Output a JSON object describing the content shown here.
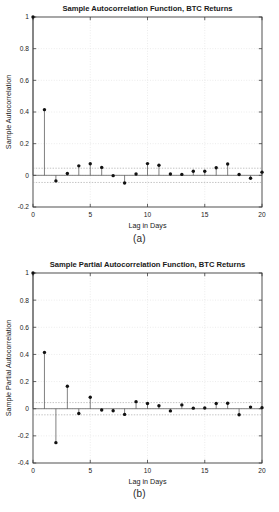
{
  "figure": {
    "panels": [
      {
        "id": "panel-a",
        "caption": "(a)",
        "chart_ref": 0
      },
      {
        "id": "panel-b",
        "caption": "(b)",
        "chart_ref": 1
      }
    ]
  },
  "chart_data": [
    {
      "type": "bar",
      "subtype": "stem",
      "title": "Sample Autocorrelation Function, BTC Returns",
      "xlabel": "Lag in Days",
      "ylabel": "Sample Autocorrelation",
      "categories": [
        0,
        1,
        2,
        3,
        4,
        5,
        6,
        7,
        8,
        9,
        10,
        11,
        12,
        13,
        14,
        15,
        16,
        17,
        18,
        19,
        20
      ],
      "values": [
        1.0,
        0.415,
        -0.035,
        0.012,
        0.06,
        0.073,
        0.05,
        -0.002,
        -0.048,
        0.008,
        0.074,
        0.064,
        0.008,
        0.006,
        0.026,
        0.026,
        0.048,
        0.072,
        0.005,
        -0.018,
        0.02
      ],
      "xlim": [
        0,
        20
      ],
      "ylim": [
        -0.2,
        1.0
      ],
      "xticks": [
        0,
        5,
        10,
        15,
        20
      ],
      "xticklabels": [
        "0",
        "5",
        "10",
        "15",
        "20"
      ],
      "yticks": [
        -0.2,
        0,
        0.2,
        0.4,
        0.6,
        0.8,
        1.0
      ],
      "yticklabels": [
        "-0.2",
        "0",
        "0.2",
        "0.4",
        "0.6",
        "0.8",
        "1"
      ],
      "grid": true,
      "legend": null,
      "confidence_bounds": [
        0.045,
        -0.045
      ],
      "marker": "filled-circle",
      "marker_color": "#111111",
      "stem_color": "#4a4a4a"
    },
    {
      "type": "bar",
      "subtype": "stem",
      "title": "Sample Partial Autocorrelation Function, BTC Returns",
      "xlabel": "Lag in Days",
      "ylabel": "Sample Partial Autocorrelation",
      "categories": [
        0,
        1,
        2,
        3,
        4,
        5,
        6,
        7,
        8,
        9,
        10,
        11,
        12,
        13,
        14,
        15,
        16,
        17,
        18,
        19,
        20
      ],
      "values": [
        1.0,
        0.415,
        -0.25,
        0.165,
        -0.035,
        0.085,
        -0.01,
        -0.015,
        -0.042,
        0.052,
        0.038,
        0.022,
        -0.016,
        0.028,
        0.004,
        0.005,
        0.038,
        0.04,
        -0.045,
        0.012,
        0.008
      ],
      "xlim": [
        0,
        20
      ],
      "ylim": [
        -0.4,
        1.0
      ],
      "xticks": [
        0,
        5,
        10,
        15,
        20
      ],
      "xticklabels": [
        "0",
        "5",
        "10",
        "15",
        "20"
      ],
      "yticks": [
        -0.4,
        -0.2,
        0,
        0.2,
        0.4,
        0.6,
        0.8,
        1.0
      ],
      "yticklabels": [
        "-0.4",
        "-0.2",
        "0",
        "0.2",
        "0.4",
        "0.6",
        "0.8",
        "1"
      ],
      "grid": true,
      "legend": null,
      "confidence_bounds": [
        0.045,
        -0.045
      ],
      "marker": "filled-circle",
      "marker_color": "#111111",
      "stem_color": "#4a4a4a"
    }
  ]
}
